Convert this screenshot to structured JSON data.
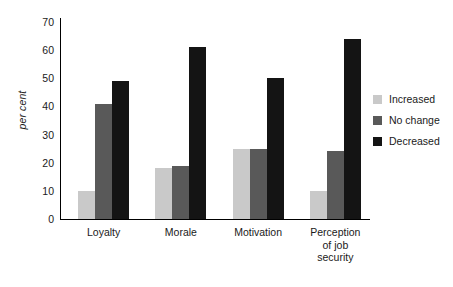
{
  "chart_data": {
    "type": "bar",
    "title": "",
    "subtitle": "",
    "xlabel": "",
    "ylabel": "per cent",
    "ylim": [
      0,
      70
    ],
    "yticks": [
      "0",
      "10",
      "20",
      "30",
      "40",
      "50",
      "60",
      "70"
    ],
    "ytick_values": [
      0,
      10,
      20,
      30,
      40,
      50,
      60,
      70
    ],
    "grid": false,
    "legend_position": "right",
    "categories": [
      "Loyalty",
      "Morale",
      "Motivation",
      "Perception\nof job\nsecurity"
    ],
    "category_lines": [
      [
        "Loyalty"
      ],
      [
        "Morale"
      ],
      [
        "Motivation"
      ],
      [
        "Perception",
        "of job",
        "security"
      ]
    ],
    "series": [
      {
        "name": "Increased",
        "color": "#c9c9c9",
        "values": [
          10,
          18,
          25,
          10
        ]
      },
      {
        "name": "No change",
        "color": "#595959",
        "values": [
          41,
          19,
          25,
          24
        ]
      },
      {
        "name": "Decreased",
        "color": "#141414",
        "values": [
          49,
          61,
          50,
          64
        ]
      }
    ]
  },
  "legend": {
    "items": [
      {
        "label": "Increased",
        "color": "#c9c9c9"
      },
      {
        "label": "No change",
        "color": "#595959"
      },
      {
        "label": "Decreased",
        "color": "#141414"
      }
    ]
  },
  "axis": {
    "y_title": "per cent"
  }
}
